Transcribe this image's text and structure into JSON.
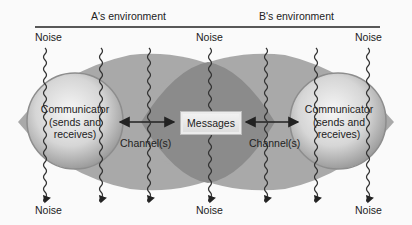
{
  "environments": {
    "a": "A's environment",
    "b": "B's environment"
  },
  "noise_labels": {
    "top": [
      "Noise",
      "Noise",
      "Noise"
    ],
    "bottom": [
      "Noise",
      "Noise",
      "Noise"
    ]
  },
  "communicator_a": {
    "line1": "Communicator",
    "line2": "(sends and",
    "line3": "receives)"
  },
  "communicator_b": {
    "line1": "Communicator",
    "line2": "(sends and",
    "line3": "receives)"
  },
  "messages": "Messages",
  "channels": [
    "Channel(s)",
    "Channel(s)"
  ],
  "colors": {
    "background": "#fafafa",
    "lens": "#a8a8a8",
    "overlap": "#8a8a8a",
    "sphere_light": "#f2f2f2",
    "sphere_dark": "#9a9a9a",
    "line": "#222222"
  }
}
